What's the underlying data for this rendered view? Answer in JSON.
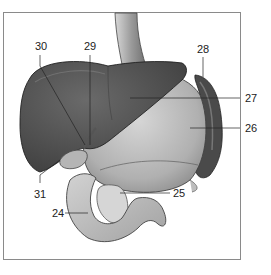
{
  "figure": {
    "labels": [
      {
        "id": "24",
        "text": "24",
        "x": 52,
        "y": 208
      },
      {
        "id": "25",
        "text": "25",
        "x": 173,
        "y": 188
      },
      {
        "id": "26",
        "text": "26",
        "x": 245,
        "y": 123
      },
      {
        "id": "27",
        "text": "27",
        "x": 245,
        "y": 93
      },
      {
        "id": "28",
        "text": "28",
        "x": 197,
        "y": 44
      },
      {
        "id": "29",
        "text": "29",
        "x": 84,
        "y": 41
      },
      {
        "id": "30",
        "text": "30",
        "x": 35,
        "y": 41
      },
      {
        "id": "31",
        "text": "31",
        "x": 34,
        "y": 189
      }
    ],
    "colors": {
      "liver": "#555555",
      "liver_dark": "#3a3a3a",
      "stomach": "#b8b8b8",
      "spleen": "#4a4a4a",
      "duodenum": "#bdbdbd",
      "pancreas": "#d4d4d4",
      "esophagus": "#a8a8a8",
      "frame": "#8a8a8a"
    }
  }
}
